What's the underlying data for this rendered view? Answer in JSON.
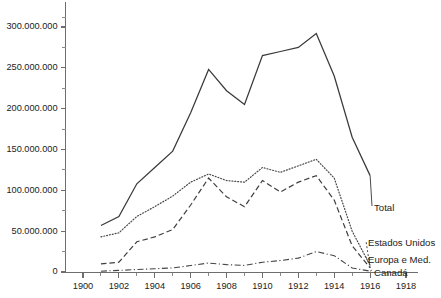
{
  "chart_data": {
    "type": "line",
    "title": "",
    "subtitle": "",
    "xlabel": "",
    "ylabel": "",
    "x": [
      1901,
      1902,
      1903,
      1904,
      1905,
      1906,
      1907,
      1908,
      1909,
      1910,
      1911,
      1912,
      1913,
      1914,
      1915,
      1916
    ],
    "xlim": [
      1899,
      1918.6
    ],
    "ylim": [
      0,
      320000000
    ],
    "grid": false,
    "legend_position": "right-inline",
    "x_tick_labels": [
      "1900",
      "1902",
      "1904",
      "1906",
      "1908",
      "1910",
      "1912",
      "1914",
      "1916",
      "1918"
    ],
    "x_tick_values": [
      1900,
      1902,
      1904,
      1906,
      1908,
      1910,
      1912,
      1914,
      1916,
      1918
    ],
    "x_minor_tick_values": [
      1901,
      1903,
      1905,
      1907,
      1909,
      1911,
      1913,
      1915,
      1917
    ],
    "y_tick_labels": [
      "0",
      "50.000.000",
      "100.000.000",
      "150.000.000",
      "200.000.000",
      "250.000.000",
      "300.000.000"
    ],
    "y_tick_values": [
      0,
      50000000,
      100000000,
      150000000,
      200000000,
      250000000,
      300000000
    ],
    "y_minor_tick_values": [
      25000000,
      75000000,
      125000000,
      175000000,
      225000000,
      275000000,
      312000000
    ],
    "series": [
      {
        "name": "Total",
        "style": "solid",
        "color": "#3a3a3a",
        "values": [
          57000000,
          68000000,
          108000000,
          128000000,
          148000000,
          195000000,
          248000000,
          222000000,
          205000000,
          265000000,
          270000000,
          275000000,
          292000000,
          240000000,
          165000000,
          118000000
        ]
      },
      {
        "name": "Estados Unidos",
        "style": "dashed",
        "color": "#3f3f3f",
        "values": [
          10000000,
          12000000,
          37000000,
          43000000,
          52000000,
          82000000,
          115000000,
          92000000,
          80000000,
          112000000,
          98000000,
          110000000,
          118000000,
          88000000,
          32000000,
          5000000
        ]
      },
      {
        "name": "Europa e Med.",
        "style": "dotted",
        "color": "#4a4a4a",
        "values": [
          43000000,
          48000000,
          68000000,
          80000000,
          93000000,
          110000000,
          120000000,
          112000000,
          110000000,
          128000000,
          122000000,
          130000000,
          138000000,
          115000000,
          50000000,
          8000000
        ]
      },
      {
        "name": "Canadá",
        "style": "dash-dot",
        "color": "#454545",
        "values": [
          1000000,
          2000000,
          3000000,
          4000000,
          5000000,
          8000000,
          11000000,
          9000000,
          8000000,
          12000000,
          14000000,
          17000000,
          25000000,
          20000000,
          5000000,
          1000000
        ]
      }
    ]
  },
  "legend": {
    "total": "Total",
    "estados_unidos": "Estados Unidos",
    "europa_med": "Europa e Med.",
    "canada": "Canadá"
  }
}
